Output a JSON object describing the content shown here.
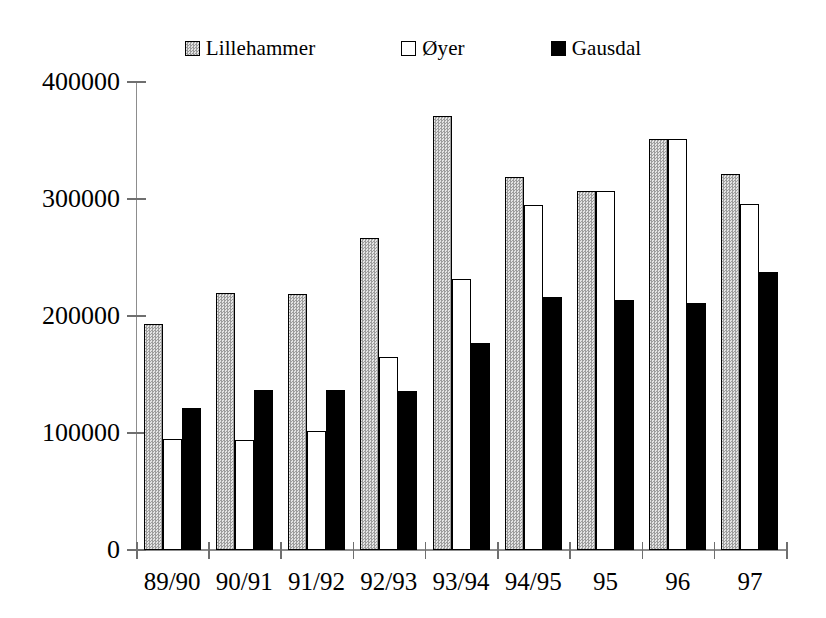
{
  "chart_data": {
    "type": "bar",
    "title": "",
    "xlabel": "",
    "ylabel": "",
    "grid": false,
    "legend_position": "top-center",
    "categories": [
      "89/90",
      "90/91",
      "91/92",
      "92/93",
      "93/94",
      "94/95",
      "95",
      "96",
      "97"
    ],
    "ylim": [
      0,
      400000
    ],
    "yticks": [
      0,
      100000,
      200000,
      300000,
      400000
    ],
    "ytick_labels": [
      "0",
      "100000",
      "200000",
      "300000",
      "400000"
    ],
    "series": [
      {
        "name": "Lillehammer",
        "color": "#b8b8b8",
        "pattern": "checkered-gray",
        "values": [
          193000,
          220000,
          219000,
          267000,
          371000,
          319000,
          307000,
          351000,
          321000
        ]
      },
      {
        "name": "Øyer",
        "color": "#ffffff",
        "pattern": "solid-white",
        "values": [
          95000,
          94000,
          102000,
          165000,
          232000,
          295000,
          307000,
          351000,
          296000
        ]
      },
      {
        "name": "Gausdal",
        "color": "#000000",
        "pattern": "solid-black",
        "values": [
          121000,
          137000,
          137000,
          136000,
          177000,
          216000,
          214000,
          211000,
          238000
        ]
      }
    ]
  },
  "legend": {
    "items": [
      {
        "label": "Lillehammer",
        "swatch": "legend-swatch-lillehammer"
      },
      {
        "label": "Øyer",
        "swatch": "legend-swatch-oyer"
      },
      {
        "label": "Gausdal",
        "swatch": "legend-swatch-gausdal"
      }
    ]
  },
  "axes": {
    "y_tick_labels": [
      "400000",
      "300000",
      "200000",
      "100000",
      "0"
    ],
    "x_tick_labels": [
      "89/90",
      "90/91",
      "91/92",
      "92/93",
      "93/94",
      "94/95",
      "95",
      "96",
      "97"
    ]
  }
}
